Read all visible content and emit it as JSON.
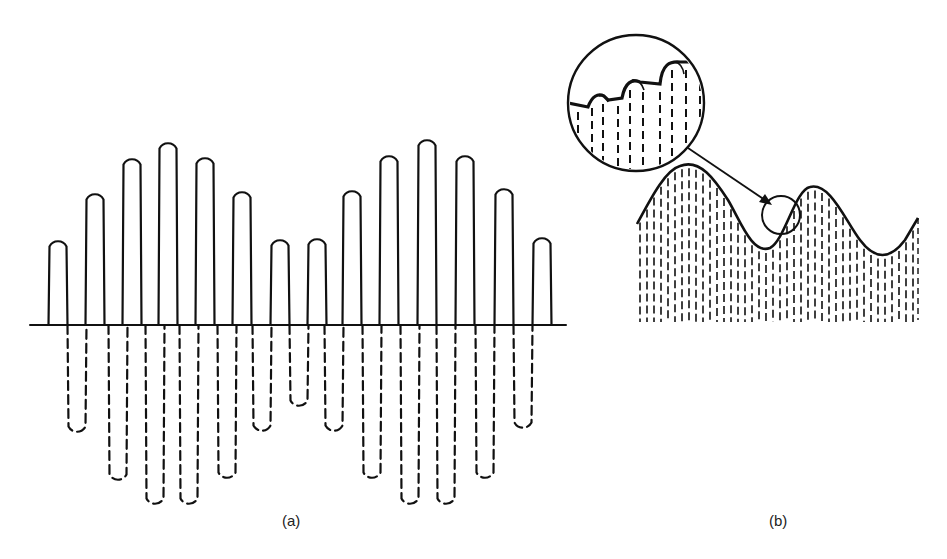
{
  "figure": {
    "panels": [
      {
        "id": "a",
        "caption": "(a)",
        "description": "Amplitude-modulated carrier wave; positive half-cycles drawn solid, negative half-cycles dashed",
        "baseline_y": 325,
        "baseline_x_range": [
          30,
          566
        ],
        "positive_peaks": [
          {
            "x": 58,
            "y": 237
          },
          {
            "x": 95,
            "y": 190
          },
          {
            "x": 132,
            "y": 155
          },
          {
            "x": 168,
            "y": 139
          },
          {
            "x": 205,
            "y": 154
          },
          {
            "x": 242,
            "y": 188
          },
          {
            "x": 280,
            "y": 236
          },
          {
            "x": 317,
            "y": 235
          },
          {
            "x": 352,
            "y": 187
          },
          {
            "x": 389,
            "y": 152
          },
          {
            "x": 427,
            "y": 136
          },
          {
            "x": 465,
            "y": 152
          },
          {
            "x": 504,
            "y": 185
          },
          {
            "x": 542,
            "y": 234
          }
        ],
        "negative_troughs": [
          {
            "x": 77,
            "y": 436
          },
          {
            "x": 118,
            "y": 484
          },
          {
            "x": 155,
            "y": 508
          },
          {
            "x": 189,
            "y": 508
          },
          {
            "x": 227,
            "y": 482
          },
          {
            "x": 262,
            "y": 435
          },
          {
            "x": 299,
            "y": 410
          },
          {
            "x": 334,
            "y": 435
          },
          {
            "x": 372,
            "y": 482
          },
          {
            "x": 410,
            "y": 508
          },
          {
            "x": 446,
            "y": 508
          },
          {
            "x": 485,
            "y": 482
          },
          {
            "x": 523,
            "y": 432
          }
        ]
      },
      {
        "id": "b",
        "caption": "(b)",
        "description": "Detected envelope over rectified carrier pulses, with magnified inset showing ripple",
        "inset": {
          "cx": 636,
          "cy": 103,
          "r": 68
        },
        "focus_circle": {
          "cx": 781,
          "cy": 215,
          "r": 19
        },
        "arrow": {
          "from": [
            690,
            148
          ],
          "to": [
            772,
            205
          ]
        }
      }
    ]
  }
}
